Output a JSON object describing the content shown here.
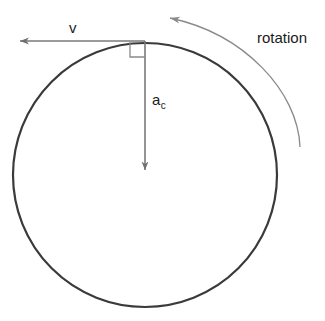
{
  "diagram": {
    "background_color": "#ffffff",
    "labels": {
      "velocity": "v",
      "acceleration_base": "a",
      "acceleration_subscript": "c",
      "rotation": "rotation"
    },
    "colors": {
      "circle_stroke": "#3a3a3a",
      "vector_stroke": "#7a7a7a",
      "arc_stroke": "#8a8a8a",
      "text": "#1b1b1b",
      "right_angle_stroke": "#8a8a8a"
    },
    "geometry": {
      "circle": {
        "center_x": 145,
        "center_y": 175,
        "radius": 132,
        "stroke_width": 2.2
      },
      "velocity_vector": {
        "from_x": 145,
        "from_y": 41,
        "to_x": 14,
        "to_y": 41,
        "direction": "left",
        "tangent_point": "top-of-circle"
      },
      "acceleration_vector": {
        "from_x": 145,
        "from_y": 41,
        "to_x": 145,
        "to_y": 176,
        "direction": "down",
        "points_to": "center"
      },
      "right_angle_marker": {
        "x": 130,
        "y": 42,
        "size": 15
      },
      "rotation_arc": {
        "start_x": 300,
        "start_y": 147,
        "end_x": 165,
        "end_y": 17,
        "arrow_at": "end",
        "sweep": "counter-clockwise-appearance"
      }
    }
  }
}
